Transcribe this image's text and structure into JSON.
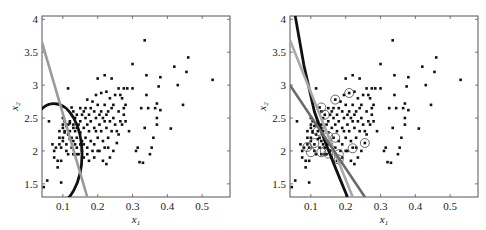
{
  "chart_data": [
    {
      "type": "scatter",
      "title": "",
      "xlabel": "x1",
      "ylabel": "x2",
      "xlim": [
        0.04,
        0.58
      ],
      "ylim": [
        1.3,
        4.05
      ],
      "xticks": [
        0.1,
        0.2,
        0.3,
        0.4,
        0.5
      ],
      "xtick_labels": [
        "0.1",
        "0.2",
        "0.3",
        "0.4",
        "0.5"
      ],
      "yticks": [
        1.5,
        2,
        2.5,
        3,
        3.5,
        4
      ],
      "ytick_labels": [
        "1.5",
        "2",
        "2.5",
        "3",
        "3.5",
        "4"
      ],
      "grid": false,
      "legend": null,
      "boundaries": [
        {
          "name": "quadratic boundary (ellipse)",
          "color": "#111111",
          "kind": "ellipse-arc"
        },
        {
          "name": "linear boundary",
          "color": "#9a9a9a",
          "kind": "line",
          "points": [
            [
              0.04,
              3.65
            ],
            [
              0.17,
              1.3
            ]
          ]
        }
      ],
      "circled_points": []
    },
    {
      "type": "scatter",
      "title": "",
      "xlabel": "x1",
      "ylabel": "x2",
      "xlim": [
        0.04,
        0.58
      ],
      "ylim": [
        1.3,
        4.05
      ],
      "xticks": [
        0.1,
        0.2,
        0.3,
        0.4,
        0.5
      ],
      "xtick_labels": [
        "0.1",
        "0.2",
        "0.3",
        "0.4",
        "0.5"
      ],
      "yticks": [
        1.5,
        2,
        2.5,
        3,
        3.5,
        4
      ],
      "ytick_labels": [
        "1.5",
        "2",
        "2.5",
        "3",
        "3.5",
        "4"
      ],
      "grid": false,
      "legend": null,
      "boundaries": [
        {
          "name": "nonlinear boundary (dark)",
          "color": "#111111",
          "kind": "curve",
          "points": [
            [
              0.055,
              4.05
            ],
            [
              0.08,
              3.3
            ],
            [
              0.11,
              2.6
            ],
            [
              0.14,
              2.15
            ],
            [
              0.17,
              1.75
            ],
            [
              0.205,
              1.3
            ]
          ]
        },
        {
          "name": "linear boundary (light)",
          "color": "#a8a8a8",
          "kind": "line",
          "points": [
            [
              0.04,
              3.68
            ],
            [
              0.22,
              1.3
            ]
          ]
        },
        {
          "name": "linear boundary (mid)",
          "color": "#6a6a6a",
          "kind": "line",
          "points": [
            [
              0.04,
              3.0
            ],
            [
              0.255,
              1.3
            ]
          ]
        }
      ],
      "circled_points": [
        [
          0.13,
          2.66
        ],
        [
          0.17,
          2.78
        ],
        [
          0.21,
          2.88
        ],
        [
          0.14,
          2.55
        ],
        [
          0.12,
          2.3
        ],
        [
          0.15,
          2.22
        ],
        [
          0.17,
          2.2
        ],
        [
          0.11,
          2.12
        ],
        [
          0.09,
          2.06
        ],
        [
          0.1,
          1.98
        ],
        [
          0.13,
          1.98
        ],
        [
          0.15,
          1.96
        ],
        [
          0.18,
          1.95
        ],
        [
          0.18,
          1.87
        ],
        [
          0.22,
          2.04
        ],
        [
          0.255,
          2.12
        ],
        [
          0.14,
          2.0
        ]
      ]
    }
  ],
  "points": [
    [
      0.045,
      1.45
    ],
    [
      0.055,
      1.55
    ],
    [
      0.06,
      2.45
    ],
    [
      0.095,
      1.52
    ],
    [
      0.07,
      2.1
    ],
    [
      0.075,
      2.0
    ],
    [
      0.075,
      1.9
    ],
    [
      0.08,
      2.05
    ],
    [
      0.085,
      1.75
    ],
    [
      0.085,
      1.85
    ],
    [
      0.09,
      2.1
    ],
    [
      0.09,
      2.3
    ],
    [
      0.095,
      1.85
    ],
    [
      0.095,
      2.05
    ],
    [
      0.1,
      2.4
    ],
    [
      0.1,
      2.5
    ],
    [
      0.1,
      2.35
    ],
    [
      0.1,
      2.2
    ],
    [
      0.105,
      2.45
    ],
    [
      0.105,
      2.28
    ],
    [
      0.11,
      2.1
    ],
    [
      0.11,
      2.0
    ],
    [
      0.11,
      2.38
    ],
    [
      0.115,
      2.95
    ],
    [
      0.115,
      2.25
    ],
    [
      0.115,
      1.95
    ],
    [
      0.12,
      2.3
    ],
    [
      0.12,
      2.18
    ],
    [
      0.12,
      2.42
    ],
    [
      0.125,
      2.66
    ],
    [
      0.125,
      2.05
    ],
    [
      0.13,
      2.6
    ],
    [
      0.13,
      2.35
    ],
    [
      0.13,
      2.15
    ],
    [
      0.135,
      2.5
    ],
    [
      0.135,
      2.3
    ],
    [
      0.14,
      2.55
    ],
    [
      0.14,
      2.2
    ],
    [
      0.14,
      2.05
    ],
    [
      0.145,
      1.95
    ],
    [
      0.15,
      2.65
    ],
    [
      0.15,
      2.45
    ],
    [
      0.15,
      2.28
    ],
    [
      0.155,
      2.15
    ],
    [
      0.155,
      2.0
    ],
    [
      0.16,
      2.6
    ],
    [
      0.16,
      2.35
    ],
    [
      0.16,
      1.9
    ],
    [
      0.165,
      2.5
    ],
    [
      0.165,
      2.2
    ],
    [
      0.17,
      2.78
    ],
    [
      0.17,
      2.4
    ],
    [
      0.17,
      2.05
    ],
    [
      0.175,
      2.55
    ],
    [
      0.175,
      2.3
    ],
    [
      0.175,
      1.85
    ],
    [
      0.18,
      2.65
    ],
    [
      0.18,
      2.45
    ],
    [
      0.18,
      2.15
    ],
    [
      0.185,
      2.0
    ],
    [
      0.19,
      2.6
    ],
    [
      0.19,
      2.35
    ],
    [
      0.19,
      1.9
    ],
    [
      0.195,
      2.85
    ],
    [
      0.195,
      2.5
    ],
    [
      0.2,
      3.1
    ],
    [
      0.2,
      2.7
    ],
    [
      0.2,
      2.2
    ],
    [
      0.205,
      2.4
    ],
    [
      0.205,
      2.0
    ],
    [
      0.21,
      2.88
    ],
    [
      0.21,
      2.6
    ],
    [
      0.21,
      2.3
    ],
    [
      0.215,
      2.15
    ],
    [
      0.215,
      1.85
    ],
    [
      0.22,
      3.15
    ],
    [
      0.22,
      2.7
    ],
    [
      0.22,
      2.45
    ],
    [
      0.22,
      2.05
    ],
    [
      0.225,
      2.9
    ],
    [
      0.225,
      2.35
    ],
    [
      0.225,
      1.8
    ],
    [
      0.23,
      2.6
    ],
    [
      0.23,
      2.2
    ],
    [
      0.235,
      2.8
    ],
    [
      0.235,
      2.45
    ],
    [
      0.235,
      1.9
    ],
    [
      0.24,
      3.1
    ],
    [
      0.24,
      2.65
    ],
    [
      0.24,
      2.3
    ],
    [
      0.245,
      2.5
    ],
    [
      0.245,
      2.0
    ],
    [
      0.25,
      2.85
    ],
    [
      0.25,
      2.4
    ],
    [
      0.255,
      2.12
    ],
    [
      0.26,
      2.95
    ],
    [
      0.26,
      2.6
    ],
    [
      0.26,
      2.25
    ],
    [
      0.265,
      2.45
    ],
    [
      0.27,
      2.8
    ],
    [
      0.27,
      2.4
    ],
    [
      0.275,
      2.65
    ],
    [
      0.275,
      2.95
    ],
    [
      0.28,
      2.45
    ],
    [
      0.285,
      2.95
    ],
    [
      0.29,
      2.3
    ],
    [
      0.3,
      3.32
    ],
    [
      0.3,
      2.95
    ],
    [
      0.31,
      2.0
    ],
    [
      0.315,
      2.05
    ],
    [
      0.32,
      1.83
    ],
    [
      0.325,
      2.65
    ],
    [
      0.33,
      1.82
    ],
    [
      0.335,
      3.68
    ],
    [
      0.335,
      2.35
    ],
    [
      0.34,
      3.15
    ],
    [
      0.34,
      2.85
    ],
    [
      0.345,
      2.65
    ],
    [
      0.35,
      1.95
    ],
    [
      0.355,
      2.05
    ],
    [
      0.36,
      2.2
    ],
    [
      0.365,
      2.65
    ],
    [
      0.37,
      2.72
    ],
    [
      0.37,
      2.5
    ],
    [
      0.37,
      2.4
    ],
    [
      0.375,
      2.98
    ],
    [
      0.38,
      3.12
    ],
    [
      0.38,
      2.62
    ],
    [
      0.41,
      2.34
    ],
    [
      0.42,
      3.28
    ],
    [
      0.43,
      3.0
    ],
    [
      0.445,
      2.7
    ],
    [
      0.455,
      3.2
    ],
    [
      0.46,
      3.42
    ],
    [
      0.53,
      3.08
    ],
    [
      0.12,
      2.45
    ],
    [
      0.13,
      2.4
    ],
    [
      0.14,
      2.35
    ],
    [
      0.105,
      2.3
    ],
    [
      0.115,
      2.4
    ],
    [
      0.125,
      2.2
    ],
    [
      0.135,
      2.1
    ],
    [
      0.145,
      2.4
    ],
    [
      0.155,
      2.55
    ],
    [
      0.165,
      2.65
    ],
    [
      0.185,
      2.75
    ],
    [
      0.195,
      2.3
    ],
    [
      0.205,
      2.55
    ],
    [
      0.215,
      2.5
    ],
    [
      0.225,
      2.55
    ],
    [
      0.245,
      2.7
    ],
    [
      0.255,
      2.3
    ],
    [
      0.265,
      2.85
    ],
    [
      0.275,
      2.55
    ],
    [
      0.28,
      2.7
    ],
    [
      0.23,
      2.05
    ],
    [
      0.2,
      2.0
    ],
    [
      0.19,
      2.1
    ],
    [
      0.17,
      1.95
    ],
    [
      0.16,
      2.1
    ],
    [
      0.15,
      2.1
    ],
    [
      0.14,
      1.95
    ],
    [
      0.13,
      1.95
    ],
    [
      0.09,
      2.2
    ],
    [
      0.1,
      2.15
    ]
  ],
  "left_panel": {
    "xlabel": "x",
    "xlabel_sub": "1",
    "ylabel": "x",
    "ylabel_sub": "2"
  },
  "right_panel": {
    "xlabel": "x",
    "xlabel_sub": "1",
    "ylabel": "x",
    "ylabel_sub": "2"
  }
}
